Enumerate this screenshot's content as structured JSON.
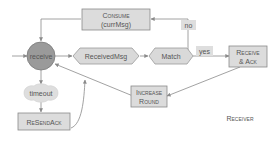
{
  "diagram": {
    "title": "Receiver",
    "nodes": {
      "receive": "receive",
      "received_msg": "ReceivedMsg",
      "match": "Match",
      "consume_line1": "Consume",
      "consume_line2": "(currMsg)",
      "receive_ack_line1": "Receive",
      "receive_ack_line2": "& Ack",
      "increase_round_line1": "Increase",
      "increase_round_line2": "Round",
      "timeout": "timeout",
      "resend_ack": "ReSendAck"
    },
    "edge_labels": {
      "no": "no",
      "yes": "yes"
    },
    "colors": {
      "node_fill": "#dcdcdc",
      "state_fill": "#9a9a9a",
      "stroke": "#8a8a8a",
      "text": "#555555"
    }
  }
}
